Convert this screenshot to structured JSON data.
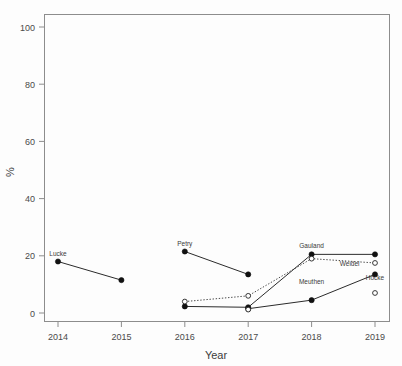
{
  "chart_data": {
    "type": "line",
    "title": "",
    "xlabel": "Year",
    "ylabel": "%",
    "xlim": [
      2013.6,
      2019.4
    ],
    "ylim": [
      0,
      100
    ],
    "xticks": [
      "2014",
      "2015",
      "2016",
      "2017",
      "2018",
      "2019"
    ],
    "yticks": [
      "0",
      "20",
      "40",
      "60",
      "80",
      "100"
    ],
    "grid": false,
    "legend": "inline-point-labels",
    "series": [
      {
        "name": "Lucke",
        "label": "Lucke",
        "style": "solid",
        "marker": "filled-circle",
        "x": [
          2014,
          2015
        ],
        "values": [
          18.0,
          11.5
        ],
        "label_x": 2014,
        "label_y": 18.0
      },
      {
        "name": "Petry",
        "label": "Petry",
        "style": "solid",
        "marker": "filled-circle",
        "x": [
          2016,
          2017
        ],
        "values": [
          21.5,
          13.5
        ],
        "label_x": 2016,
        "label_y": 21.5
      },
      {
        "name": "Gauland",
        "label": "Gauland",
        "style": "solid",
        "marker": "filled-circle",
        "x": [
          2016,
          2017,
          2018,
          2019
        ],
        "values": [
          2.3,
          2.0,
          20.5,
          20.5
        ],
        "label_x": 2018,
        "label_y": 20.5
      },
      {
        "name": "Weidel",
        "label": "Weidel",
        "style": "dotted",
        "marker": "open-circle",
        "x": [
          2016,
          2017,
          2018,
          2019
        ],
        "values": [
          4.0,
          6.0,
          19.0,
          17.5
        ],
        "label_x": 2018.6,
        "label_y": 14.5
      },
      {
        "name": "Meuthen",
        "label": "Meuthen",
        "style": "solid",
        "marker": "filled-circle",
        "x": [
          2017,
          2018,
          2019
        ],
        "values": [
          1.5,
          4.5,
          13.5
        ],
        "label_x": 2018,
        "label_y": 8.0
      },
      {
        "name": "Höcke",
        "label": "Höcke",
        "style": "none",
        "marker": "open-circle",
        "x": [
          2017,
          2019
        ],
        "values": [
          1.2,
          7.0
        ],
        "label_x": 2019,
        "label_y": 9.5
      }
    ]
  },
  "axes": {
    "x_title": "Year",
    "y_title": "%",
    "x_tick_labels": [
      "2014",
      "2015",
      "2016",
      "2017",
      "2018",
      "2019"
    ],
    "y_tick_labels": [
      "0",
      "20",
      "40",
      "60",
      "80",
      "100"
    ]
  },
  "point_labels": {
    "lucke": "Lucke",
    "petry": "Petry",
    "gauland": "Gauland",
    "weidel": "Weidel",
    "meuthen": "Meuthen",
    "hoecke": "Höcke"
  },
  "colors": {
    "background": "#fdfdfd",
    "frame": "#8d8d8d",
    "line": "#2b2b2b",
    "text": "#3a3a3a"
  }
}
